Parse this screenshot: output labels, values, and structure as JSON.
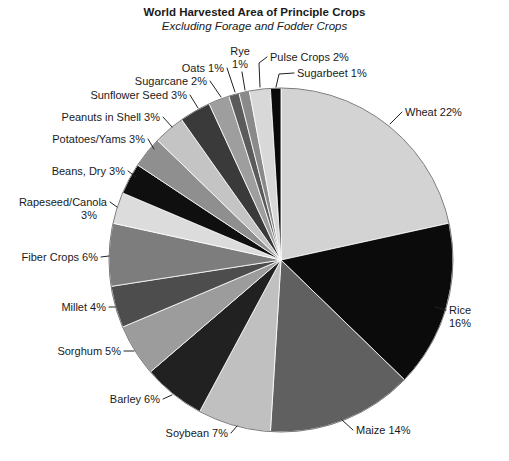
{
  "chart": {
    "title": "World Harvested Area of Principle Crops",
    "subtitle": "Excluding Forage and Fodder Crops"
  },
  "chart_data": {
    "type": "pie",
    "title": "World Harvested Area of Principle Crops",
    "subtitle": "Excluding Forage and Fodder Crops",
    "unit": "%",
    "start_angle": "12-oclock",
    "direction": "clockwise",
    "palette_note": "grayscale",
    "slices": [
      {
        "id": "wheat",
        "name": "Wheat",
        "value": 22,
        "label_lines": [
          "Wheat 22%"
        ],
        "color": "#d3d3d3"
      },
      {
        "id": "rice",
        "name": "Rice",
        "value": 16,
        "label_lines": [
          "Rice",
          "16%"
        ],
        "color": "#0b0b0b"
      },
      {
        "id": "maize",
        "name": "Maize",
        "value": 14,
        "label_lines": [
          "Maize 14%"
        ],
        "color": "#606060"
      },
      {
        "id": "soybean",
        "name": "Soybean",
        "value": 7,
        "label_lines": [
          "Soybean 7%"
        ],
        "color": "#c0c0c0"
      },
      {
        "id": "barley",
        "name": "Barley",
        "value": 6,
        "label_lines": [
          "Barley 6%"
        ],
        "color": "#212121"
      },
      {
        "id": "sorghum",
        "name": "Sorghum",
        "value": 5,
        "label_lines": [
          "Sorghum 5%"
        ],
        "color": "#9c9c9c"
      },
      {
        "id": "millet",
        "name": "Millet",
        "value": 4,
        "label_lines": [
          "Millet 4%"
        ],
        "color": "#4d4d4d"
      },
      {
        "id": "fiber-crops",
        "name": "Fiber Crops",
        "value": 6,
        "label_lines": [
          "Fiber Crops 6%"
        ],
        "color": "#7d7d7d"
      },
      {
        "id": "rapeseed-canola",
        "name": "Rapeseed/Canola",
        "value": 3,
        "label_lines": [
          "Rapeseed/Canola",
          "3%"
        ],
        "color": "#dcdcdc"
      },
      {
        "id": "beans-dry",
        "name": "Beans, Dry",
        "value": 3,
        "label_lines": [
          "Beans, Dry 3%"
        ],
        "color": "#0f0f0f"
      },
      {
        "id": "potatoes-yams",
        "name": "Potatoes/Yams",
        "value": 3,
        "label_lines": [
          "Potatoes/Yams 3%"
        ],
        "color": "#8f8f8f"
      },
      {
        "id": "peanuts-in-shell",
        "name": "Peanuts in Shell",
        "value": 3,
        "label_lines": [
          "Peanuts in Shell 3%"
        ],
        "color": "#c4c4c4"
      },
      {
        "id": "sunflower-seed",
        "name": "Sunflower Seed",
        "value": 3,
        "label_lines": [
          "Sunflower Seed 3%"
        ],
        "color": "#3a3a3a"
      },
      {
        "id": "sugarcane",
        "name": "Sugarcane",
        "value": 2,
        "label_lines": [
          "Sugarcane 2%"
        ],
        "color": "#9e9e9e"
      },
      {
        "id": "oats",
        "name": "Oats",
        "value": 1,
        "label_lines": [
          "Oats 1%"
        ],
        "color": "#5b5b5b"
      },
      {
        "id": "rye",
        "name": "Rye",
        "value": 1,
        "label_lines": [
          "Rye",
          "1%"
        ],
        "color": "#8a8a8a"
      },
      {
        "id": "pulse-crops",
        "name": "Pulse Crops",
        "value": 2,
        "label_lines": [
          "Pulse Crops 2%"
        ],
        "color": "#d8d8d8"
      },
      {
        "id": "sugarbeet",
        "name": "Sugarbeet",
        "value": 1,
        "label_lines": [
          "Sugarbeet 1%"
        ],
        "color": "#0a0a0a"
      }
    ]
  }
}
